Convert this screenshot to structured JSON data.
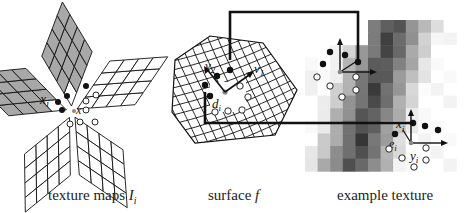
{
  "captions": {
    "texture_maps": "texture maps ",
    "texture_maps_var": "I",
    "texture_maps_sub": "i",
    "surface": "surface ",
    "surface_var": "f",
    "example_texture": "example texture"
  },
  "labels": {
    "xi": "x",
    "xi_sub": "i",
    "x": "x",
    "v1": "v",
    "v1_sub": "1",
    "v2": "v",
    "v2_sub": "2",
    "di": "d",
    "di_sub": "i",
    "xi_prime": "x",
    "xi_prime_sup": "i",
    "ei": "e",
    "ei_sub": "i",
    "yi_prime": "y",
    "yi_prime_sup": "i"
  },
  "colors": {
    "shaded_cell": "#a8a8a8",
    "line": "#111111",
    "center_point": "#888888"
  }
}
